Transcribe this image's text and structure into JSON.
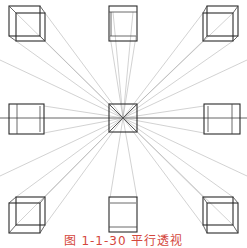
{
  "figure": {
    "title": "平行透视",
    "caption": "图 1-1-30  平行透视",
    "caption_color": "#d4463c",
    "line_color": "#2a2a2a",
    "guide_color": "#9a9a9a",
    "vanishing_point": {
      "x": 123,
      "y": 118
    },
    "horizon_y": 118,
    "cubes": [
      {
        "position": "top-left"
      },
      {
        "position": "top-center"
      },
      {
        "position": "top-right"
      },
      {
        "position": "middle-left"
      },
      {
        "position": "center"
      },
      {
        "position": "middle-right"
      },
      {
        "position": "bottom-left"
      },
      {
        "position": "bottom-center"
      },
      {
        "position": "bottom-right"
      }
    ]
  }
}
